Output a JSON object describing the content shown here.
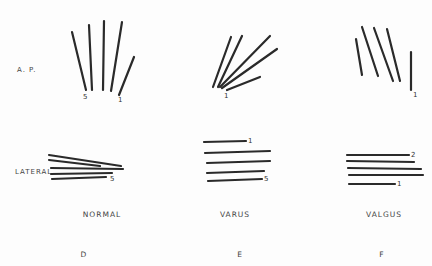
{
  "row_labels": {
    "ap": "A. P.",
    "lateral": "LATERAL"
  },
  "panels": [
    {
      "id": "normal",
      "caption": "NORMAL",
      "letter": "D"
    },
    {
      "id": "varus",
      "caption": "VARUS",
      "letter": "E"
    },
    {
      "id": "valgus",
      "caption": "VALGUS",
      "letter": "F"
    }
  ],
  "numbers": {
    "normal_ap_5": "5",
    "normal_ap_1": "1",
    "varus_ap_1": "1",
    "valgus_ap_1": "1",
    "normal_lat_5": "5",
    "varus_lat_1": "1",
    "varus_lat_5": "5",
    "valgus_lat_2": "2",
    "valgus_lat_1": "1"
  },
  "line_color": "#2a2a2a"
}
